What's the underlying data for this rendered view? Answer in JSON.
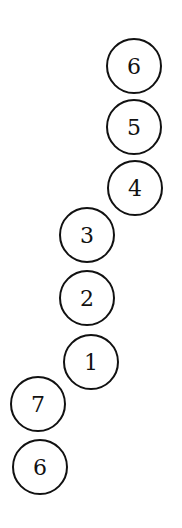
{
  "diagram": {
    "nodes": [
      {
        "label": "6",
        "cx": 134,
        "cy": 66
      },
      {
        "label": "5",
        "cx": 134,
        "cy": 127
      },
      {
        "label": "4",
        "cx": 135,
        "cy": 188
      },
      {
        "label": "3",
        "cx": 87,
        "cy": 235
      },
      {
        "label": "2",
        "cx": 87,
        "cy": 298
      },
      {
        "label": "1",
        "cx": 91,
        "cy": 362
      },
      {
        "label": "7",
        "cx": 38,
        "cy": 404
      },
      {
        "label": "6",
        "cx": 40,
        "cy": 467
      }
    ]
  }
}
